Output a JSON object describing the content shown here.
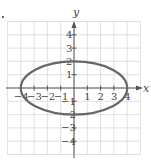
{
  "chart_data": {
    "type": "line",
    "title": "",
    "equation": "x^2/16 + y^2/4 = 1",
    "xlabel": "x",
    "ylabel": "y",
    "xlim": [
      -5,
      5
    ],
    "ylim": [
      -5,
      5
    ],
    "grid": true,
    "x_ticks": [
      -4,
      -3,
      -2,
      -1,
      1,
      2,
      3,
      4
    ],
    "y_ticks": [
      -4,
      -3,
      -2,
      -1,
      1,
      2,
      3,
      4
    ],
    "x_tick_labels": [
      "−4",
      "−3",
      "−2",
      "−1",
      "1",
      "2",
      "3",
      "4"
    ],
    "y_tick_labels": [
      "−4",
      "−3",
      "−2",
      "−1",
      "1",
      "2",
      "3",
      "4"
    ],
    "series": [
      {
        "name": "ellipse",
        "shape": "ellipse",
        "center": [
          0,
          0
        ],
        "rx": 4,
        "ry": 2,
        "points": [
          [
            4,
            0
          ],
          [
            0,
            2
          ],
          [
            -4,
            0
          ],
          [
            0,
            -2
          ]
        ]
      }
    ],
    "legend": null
  },
  "labels": {
    "x_axis": "x",
    "y_axis": "y"
  },
  "colors": {
    "grid": "#d9d9d9",
    "axis": "#555555",
    "curve": "#666666",
    "text": "#444444"
  }
}
